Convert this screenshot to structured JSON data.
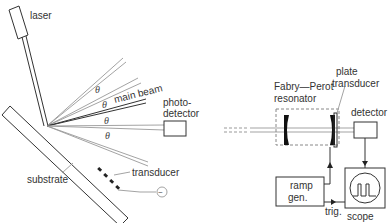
{
  "left_diagram": {
    "labels": {
      "laser": "laser",
      "main_beam": "main beam",
      "photodetector_line1": "photo-",
      "photodetector_line2": "detector",
      "substrate": "substrate",
      "transducer": "transducer",
      "ac_source": "~"
    },
    "angle_symbol": "θ",
    "angle_count": 4
  },
  "right_diagram": {
    "labels": {
      "fabry_perot_line1": "Fabry—Perot",
      "fabry_perot_line2": "resonator",
      "plate_line1": "plate",
      "plate_line2": "transducer",
      "detector": "detector",
      "ramp_line1": "ramp",
      "ramp_line2": "gen.",
      "trig": "trig.",
      "scope": "scope"
    }
  }
}
